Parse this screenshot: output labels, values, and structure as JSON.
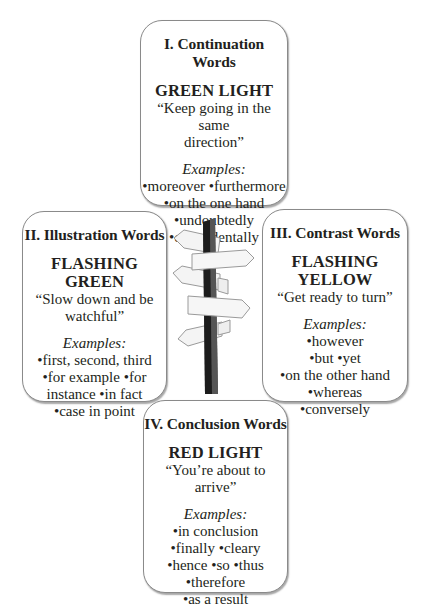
{
  "diagram": {
    "center_icon": "signpost-icon"
  },
  "cards": [
    {
      "title": "I. Continuation Words",
      "light": "GREEN LIGHT",
      "quote_lines": [
        "“Keep going in the same",
        "direction”"
      ],
      "examples_label": "Examples:",
      "example_lines": [
        "•moreover •furthermore",
        "•on the one hand",
        "•undoubtedly",
        "•coincidentally"
      ]
    },
    {
      "title": "II. Illustration Words",
      "light": "FLASHING GREEN",
      "quote_lines": [
        "“Slow down and be",
        "watchful”"
      ],
      "examples_label": "Examples:",
      "example_lines": [
        "•first, second, third",
        "•for example •for",
        "instance •in fact",
        "•case in point"
      ]
    },
    {
      "title": "III. Contrast Words",
      "light": "FLASHING YELLOW",
      "quote_lines": [
        "“Get ready to turn”"
      ],
      "examples_label": "Examples:",
      "example_lines": [
        "•however",
        "•but •yet",
        "•on the other hand",
        "•whereas",
        "•conversely"
      ]
    },
    {
      "title": "IV. Conclusion Words",
      "light": "RED LIGHT",
      "quote_lines": [
        "“You’re about to arrive”"
      ],
      "examples_label": "Examples:",
      "example_lines": [
        "•in conclusion",
        "•finally •cleary",
        "•hence •so •thus",
        "•therefore",
        "•as a result"
      ]
    }
  ],
  "colors": {
    "text": "#231f20",
    "border": "#8a8a8a",
    "post_dark": "#1c1c1c",
    "post_mid": "#4a4a4a",
    "sign_fill": "#f4f4f4",
    "sign_stroke": "#9a9a9a"
  }
}
